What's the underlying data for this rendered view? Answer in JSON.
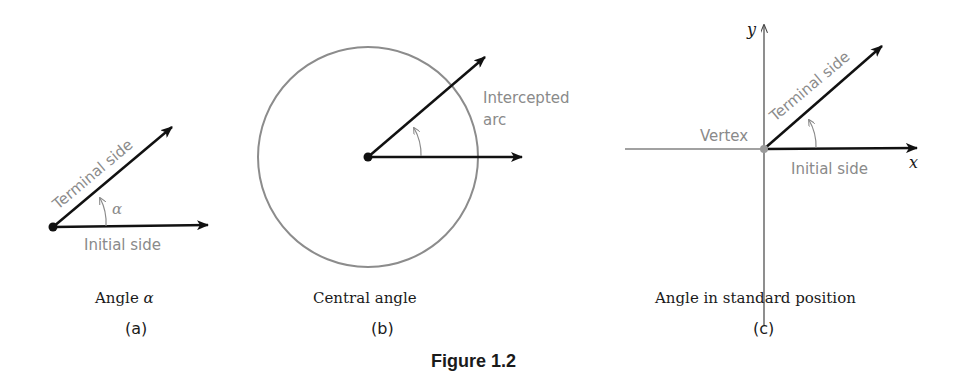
{
  "figure": {
    "title": "Figure 1.2",
    "colors": {
      "ray": "#111111",
      "label_gray": "#8a8a8a",
      "circle": "#8c8c8c",
      "axis": "#444444",
      "vertex_gray": "#9a9a9a"
    },
    "panels": [
      {
        "id": "a",
        "letter": "(a)",
        "caption_prefix": "Angle ",
        "caption_symbol": "α",
        "labels": {
          "terminal": "Terminal side",
          "initial": "Initial side",
          "angle": "α"
        }
      },
      {
        "id": "b",
        "letter": "(b)",
        "caption": "Central angle",
        "labels": {
          "arc_line1": "Intercepted",
          "arc_line2": "arc"
        }
      },
      {
        "id": "c",
        "letter": "(c)",
        "caption": "Angle in standard position",
        "labels": {
          "terminal": "Terminal side",
          "initial": "Initial side",
          "vertex": "Vertex",
          "x_axis": "x",
          "y_axis": "y"
        }
      }
    ]
  }
}
